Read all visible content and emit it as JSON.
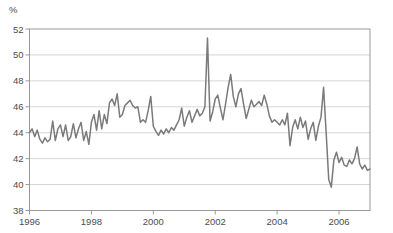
{
  "chart": {
    "unit_label": "%",
    "colors": {
      "line": "#7a7a7a",
      "grid": "#cccccc",
      "axis": "#999999",
      "text": "#4d4d4d",
      "background": "#ffffff"
    }
  },
  "chart_data": {
    "type": "line",
    "title": "",
    "xlabel": "",
    "ylabel": "%",
    "ylim": [
      38,
      52
    ],
    "yticks": [
      38,
      40,
      42,
      44,
      46,
      48,
      50,
      52
    ],
    "ytick_labels": [
      "38",
      "40",
      "42",
      "44",
      "46",
      "48",
      "50",
      "52"
    ],
    "xtick_years": [
      1996,
      1998,
      2000,
      2002,
      2004,
      2006
    ],
    "xtick_labels": [
      "1996",
      "1998",
      "2000",
      "2002",
      "2004",
      "2006"
    ],
    "x_start": {
      "year": 1996,
      "month": 1
    },
    "x_end": {
      "year": 2007,
      "month": 1
    },
    "frequency": "monthly",
    "grid": true,
    "legend_position": "none",
    "series": [
      {
        "name": "value",
        "values": [
          44.0,
          44.3,
          43.7,
          44.2,
          43.5,
          43.2,
          43.6,
          43.3,
          43.5,
          44.9,
          43.4,
          44.3,
          44.6,
          43.7,
          44.6,
          43.4,
          43.7,
          44.7,
          43.6,
          44.3,
          44.8,
          43.4,
          44.1,
          43.1,
          44.8,
          45.4,
          44.2,
          45.7,
          44.3,
          45.4,
          44.7,
          46.3,
          46.6,
          46.1,
          47.0,
          45.2,
          45.4,
          46.1,
          46.3,
          46.5,
          46.1,
          45.9,
          46.0,
          44.8,
          45.0,
          44.8,
          45.7,
          46.8,
          44.5,
          44.1,
          43.8,
          44.2,
          43.9,
          44.3,
          44.0,
          44.4,
          44.2,
          44.6,
          45.0,
          45.9,
          44.5,
          45.2,
          45.7,
          44.8,
          45.3,
          45.8,
          45.3,
          45.5,
          46.0,
          51.3,
          44.9,
          45.6,
          46.6,
          46.9,
          45.9,
          45.0,
          46.2,
          47.5,
          48.5,
          46.8,
          46.0,
          47.0,
          47.4,
          46.2,
          45.1,
          45.8,
          46.5,
          46.0,
          46.2,
          46.4,
          46.1,
          46.9,
          46.2,
          45.3,
          44.8,
          45.0,
          44.8,
          44.6,
          45.0,
          44.6,
          45.5,
          43.0,
          44.4,
          45.0,
          44.3,
          45.2,
          44.4,
          44.9,
          43.5,
          44.3,
          44.8,
          43.4,
          44.5,
          45.2,
          47.5,
          44.0,
          40.4,
          39.8,
          41.9,
          42.5,
          41.7,
          42.1,
          41.5,
          41.4,
          41.9,
          41.6,
          42.0,
          42.9,
          41.6,
          41.2,
          41.5,
          41.1,
          41.2
        ]
      }
    ]
  }
}
